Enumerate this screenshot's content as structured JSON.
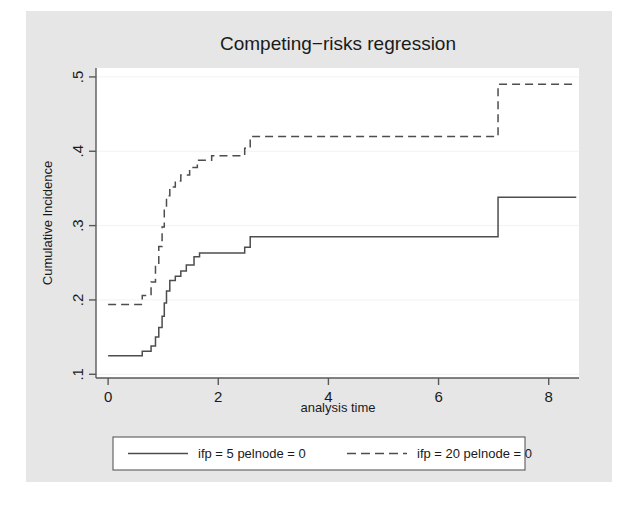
{
  "figure": {
    "background_outer": "#ffffff",
    "background_graph": "#e6e6e6",
    "plot_background": "#ffffff",
    "axis_color": "#595959",
    "grid_color": "#f2f2f2",
    "series_color": "#4d4d4d"
  },
  "chart_data": {
    "type": "line",
    "title": "Competing−risks regression",
    "xlabel": "analysis time",
    "ylabel": "Cumulative Incidence",
    "xlim": [
      -0.22,
      8.55
    ],
    "ylim": [
      0.095,
      0.512
    ],
    "xticks": [
      0,
      2,
      4,
      6,
      8
    ],
    "xtick_labels": [
      "0",
      "2",
      "4",
      "6",
      "8"
    ],
    "yticks": [
      0.1,
      0.2,
      0.3,
      0.4,
      0.5
    ],
    "ytick_labels": [
      ".1",
      ".2",
      ".3",
      ".4",
      ".5"
    ],
    "grid": true,
    "grid_axis": "y",
    "legend_position": "below",
    "interpolation": "step-post",
    "series": [
      {
        "name": "ifp = 5 pelnode = 0",
        "style": "solid",
        "color": "#4d4d4d",
        "points": [
          [
            0.0,
            0.125
          ],
          [
            0.62,
            0.125
          ],
          [
            0.62,
            0.131
          ],
          [
            0.78,
            0.131
          ],
          [
            0.78,
            0.138
          ],
          [
            0.86,
            0.138
          ],
          [
            0.86,
            0.15
          ],
          [
            0.92,
            0.15
          ],
          [
            0.92,
            0.163
          ],
          [
            0.98,
            0.163
          ],
          [
            0.98,
            0.178
          ],
          [
            1.02,
            0.178
          ],
          [
            1.02,
            0.196
          ],
          [
            1.06,
            0.196
          ],
          [
            1.06,
            0.212
          ],
          [
            1.12,
            0.212
          ],
          [
            1.12,
            0.226
          ],
          [
            1.22,
            0.226
          ],
          [
            1.22,
            0.232
          ],
          [
            1.32,
            0.232
          ],
          [
            1.32,
            0.239
          ],
          [
            1.42,
            0.239
          ],
          [
            1.42,
            0.247
          ],
          [
            1.56,
            0.247
          ],
          [
            1.56,
            0.258
          ],
          [
            1.66,
            0.258
          ],
          [
            1.66,
            0.263
          ],
          [
            2.48,
            0.263
          ],
          [
            2.48,
            0.271
          ],
          [
            2.58,
            0.271
          ],
          [
            2.58,
            0.285
          ],
          [
            7.08,
            0.285
          ],
          [
            7.08,
            0.338
          ],
          [
            8.5,
            0.338
          ]
        ]
      },
      {
        "name": "ifp = 20 pelnode = 0",
        "style": "dashed",
        "color": "#4d4d4d",
        "points": [
          [
            0.0,
            0.194
          ],
          [
            0.62,
            0.194
          ],
          [
            0.62,
            0.206
          ],
          [
            0.78,
            0.206
          ],
          [
            0.78,
            0.224
          ],
          [
            0.86,
            0.224
          ],
          [
            0.86,
            0.248
          ],
          [
            0.92,
            0.248
          ],
          [
            0.92,
            0.272
          ],
          [
            0.98,
            0.272
          ],
          [
            0.98,
            0.298
          ],
          [
            1.02,
            0.298
          ],
          [
            1.02,
            0.322
          ],
          [
            1.06,
            0.322
          ],
          [
            1.06,
            0.34
          ],
          [
            1.12,
            0.34
          ],
          [
            1.12,
            0.352
          ],
          [
            1.22,
            0.352
          ],
          [
            1.22,
            0.36
          ],
          [
            1.32,
            0.36
          ],
          [
            1.32,
            0.368
          ],
          [
            1.48,
            0.368
          ],
          [
            1.48,
            0.378
          ],
          [
            1.62,
            0.378
          ],
          [
            1.62,
            0.388
          ],
          [
            1.88,
            0.388
          ],
          [
            1.88,
            0.394
          ],
          [
            2.48,
            0.394
          ],
          [
            2.48,
            0.404
          ],
          [
            2.58,
            0.404
          ],
          [
            2.58,
            0.42
          ],
          [
            7.08,
            0.42
          ],
          [
            7.08,
            0.49
          ],
          [
            8.5,
            0.49
          ]
        ]
      }
    ]
  },
  "legend": {
    "entries": [
      {
        "label": "ifp = 5 pelnode = 0",
        "style": "solid"
      },
      {
        "label": "ifp = 20 pelnode = 0",
        "style": "dashed"
      }
    ]
  }
}
